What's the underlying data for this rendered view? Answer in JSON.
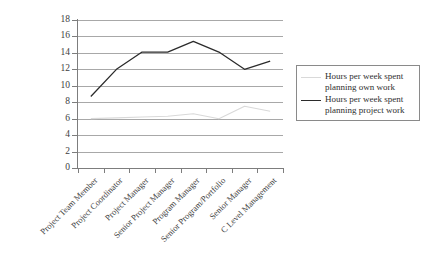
{
  "chart_data": {
    "type": "line",
    "title": "",
    "subtitle": "",
    "xlabel": "",
    "ylabel": "",
    "ylim": [
      0,
      18
    ],
    "ytick_step": 2,
    "yticks": [
      18,
      16,
      14,
      12,
      10,
      8,
      6,
      4,
      2,
      0
    ],
    "grid": true,
    "grid_axis": "y",
    "legend_position": "right",
    "categories": [
      "Project Team Member",
      "Project Coordinator",
      "Project Manager",
      "Senior Project Manager",
      "Program Manager",
      "Senior Program/Portfolio",
      "Senior Manager",
      "C Level Management"
    ],
    "series": [
      {
        "name": "Hours per week spent planning own work",
        "color": "#d9d9d9",
        "values": [
          6.0,
          6.1,
          6.2,
          6.3,
          6.6,
          6.0,
          7.5,
          6.9
        ]
      },
      {
        "name": "Hours per week spent planning project work",
        "color": "#2b2b2b",
        "values": [
          8.7,
          12.0,
          14.1,
          14.1,
          15.4,
          14.1,
          12.0,
          13.0
        ]
      }
    ]
  },
  "legend": {
    "items": [
      {
        "label": "Hours per week spent planning own work",
        "color": "#d9d9d9"
      },
      {
        "label": "Hours per week spent planning project work",
        "color": "#2b2b2b"
      }
    ]
  },
  "axes": {
    "y_labels": [
      "18",
      "16",
      "14",
      "12",
      "10",
      "8",
      "6",
      "4",
      "2",
      "0"
    ],
    "x_labels": [
      "Project Team Member",
      "Project Coordinator",
      "Project Manager",
      "Senior Project Manager",
      "Program Manager",
      "Senior Program/Portfolio",
      "Senior Manager",
      "C Level Management"
    ]
  }
}
